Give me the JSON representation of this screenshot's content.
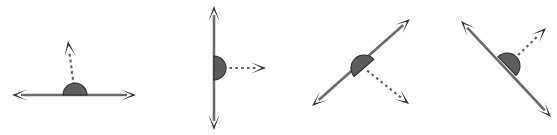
{
  "page": {
    "background_color": "#ffffff",
    "width": 557,
    "height": 135
  },
  "style": {
    "solid_line_color": "#6b6b6b",
    "dashed_ray_color": "#5c5c5c",
    "arrowhead_color": "#2e2e2e",
    "arc_fill_color": "#5d5d5d",
    "arc_stroke_color": "#2c2c2c"
  },
  "figures": [
    {
      "id": "figure-1",
      "label": "horizontal-line-with-vertical-dashed-ray",
      "vertex": {
        "x": 75,
        "y": 95
      },
      "line": {
        "x1": 12,
        "y1": 95,
        "x2": 136,
        "y2": 95,
        "arrows": "both"
      },
      "ray": {
        "x1": 75,
        "y1": 95,
        "x2": 68,
        "y2": 41,
        "arrow": "end",
        "dashed": true
      },
      "arc": {
        "cx": 75,
        "cy": 95,
        "r": 12,
        "rotation": 0,
        "sweep": "above-line"
      }
    },
    {
      "id": "figure-2",
      "label": "vertical-line-with-horizontal-dashed-ray",
      "vertex": {
        "x": 214,
        "y": 68
      },
      "line": {
        "x1": 214,
        "y1": 6,
        "x2": 214,
        "y2": 130,
        "arrows": "both"
      },
      "ray": {
        "x1": 214,
        "y1": 68,
        "x2": 266,
        "y2": 68,
        "arrow": "end",
        "dashed": true
      },
      "arc": {
        "cx": 214,
        "cy": 68,
        "r": 12,
        "rotation": 90,
        "sweep": "right-of-line"
      }
    },
    {
      "id": "figure-3",
      "label": "rising-diagonal-line-with-dashed-ray-down-right",
      "vertex": {
        "x": 364,
        "y": 68
      },
      "line": {
        "x1": 312,
        "y1": 106,
        "x2": 410,
        "y2": 19,
        "arrows": "both"
      },
      "ray": {
        "x1": 364,
        "y1": 68,
        "x2": 409,
        "y2": 104,
        "arrow": "end",
        "dashed": true
      },
      "arc": {
        "cx": 364,
        "cy": 68,
        "r": 13,
        "rotation": -41,
        "sweep": "above-line"
      }
    },
    {
      "id": "figure-4",
      "label": "falling-diagonal-line-with-dashed-ray-up-right",
      "vertex": {
        "x": 507,
        "y": 66
      },
      "line": {
        "x1": 461,
        "y1": 21,
        "x2": 551,
        "y2": 117,
        "arrows": "both"
      },
      "ray": {
        "x1": 507,
        "y1": 66,
        "x2": 546,
        "y2": 28,
        "arrow": "end",
        "dashed": true
      },
      "arc": {
        "cx": 507,
        "cy": 66,
        "r": 13,
        "rotation": 46,
        "sweep": "above-line"
      }
    }
  ]
}
